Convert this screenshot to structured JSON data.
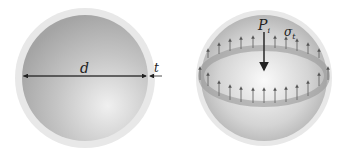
{
  "figure": {
    "left_sphere": {
      "labels": {
        "diameter": "d",
        "thickness": "t"
      }
    },
    "right_sphere": {
      "labels": {
        "pressure": "P",
        "pressure_sub": "i",
        "stress": "σ",
        "stress_sub": "t"
      }
    },
    "colors": {
      "shell_outer": "#e6e6e6",
      "sphere_dark": "#a9a9a9",
      "sphere_light": "#f2f2f2",
      "band": "#9a9a9a",
      "arrow": "#555555",
      "dim_line": "#222222"
    }
  }
}
